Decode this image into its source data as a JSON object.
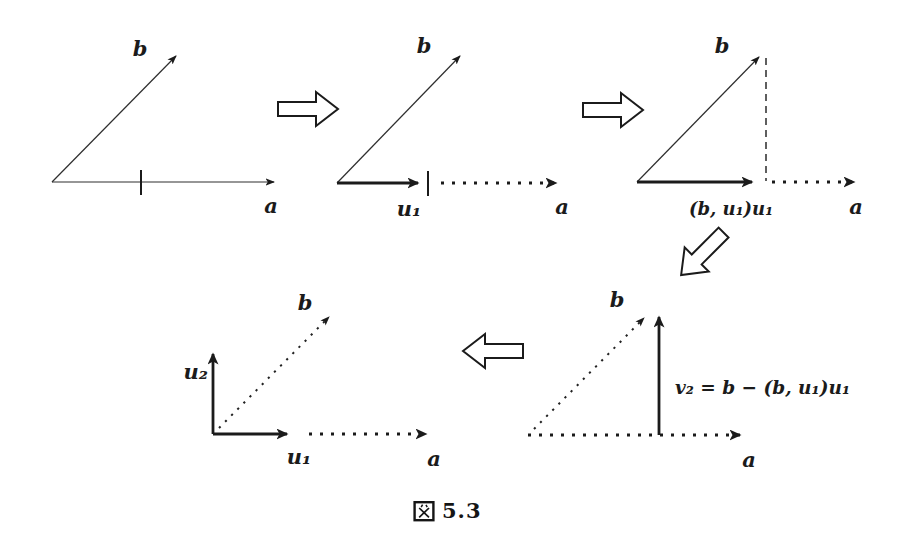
{
  "page": {
    "background": "#ffffff",
    "ink_color": "#1b1b1b",
    "description_type": "gram-schmidt-orthogonalization-figure"
  },
  "caption": {
    "kanji": "図",
    "number": "5.3"
  },
  "diagrams": {
    "step1": {
      "b": "b",
      "a": "a"
    },
    "step2": {
      "b": "b",
      "u1": "u₁",
      "a": "a"
    },
    "step3": {
      "b": "b",
      "projection": "(b, u₁)u₁",
      "a": "a"
    },
    "step4": {
      "b": "b",
      "formula": "v₂ = b − (b, u₁)u₁",
      "a": "a"
    },
    "step5": {
      "b": "b",
      "u2": "u₂",
      "u1": "u₁",
      "a": "a"
    }
  }
}
